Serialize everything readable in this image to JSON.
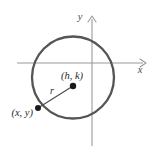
{
  "figure": {
    "name": "circle-standard-form-diagram",
    "width": 156,
    "height": 156,
    "background_color": "#ffffff"
  },
  "axes": {
    "x_axis": {
      "label": "x",
      "label_x": 140,
      "label_y": 73,
      "y_position": 63,
      "x_start": 17,
      "x_end": 143,
      "color": "#9a9a9a",
      "stroke_width": 1.1,
      "arrow": "right"
    },
    "y_axis": {
      "label": "y",
      "label_x": 80,
      "label_y": 20,
      "x_position": 92,
      "y_start": 19,
      "y_end": 146,
      "color": "#9a9a9a",
      "stroke_width": 1.1,
      "arrow": "up"
    }
  },
  "circle": {
    "center_x": 73,
    "center_y": 77.5,
    "radius": 41,
    "color": "#555555",
    "stroke_width": 2.3,
    "fill": "none"
  },
  "points": [
    {
      "id": "center-point",
      "label": "(h, k)",
      "cx": 73,
      "cy": 86,
      "dot_radius": 3.2,
      "color": "#1a1a1a",
      "label_x": 72,
      "label_y": 79,
      "label_anchor": "middle",
      "font_size": 10.5
    },
    {
      "id": "circle-point",
      "label": "(x, y)",
      "cx": 38,
      "cy": 108,
      "dot_radius": 3.0,
      "color": "#1a1a1a",
      "label_x": 33,
      "label_y": 116,
      "label_anchor": "end",
      "font_size": 10.5
    }
  ],
  "radius_segment": {
    "label": "r",
    "x1": 38,
    "y1": 108,
    "x2": 73,
    "y2": 86,
    "color": "#4a4a4a",
    "stroke_width": 1.1,
    "label_x": 52,
    "label_y": 94,
    "font_size": 10
  },
  "colors": {
    "circle_stroke": "#555555",
    "axis_stroke": "#9a9a9a",
    "point_fill": "#1a1a1a",
    "text": "#2b2b2b",
    "background": "#ffffff"
  }
}
